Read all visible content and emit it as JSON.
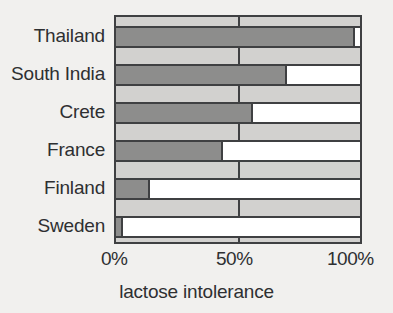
{
  "chart_data": {
    "type": "bar",
    "orientation": "horizontal",
    "title": "",
    "xlabel": "lactose intolerance",
    "ylabel": "",
    "xlim": [
      0,
      100
    ],
    "xticks": [
      0,
      50,
      100
    ],
    "xtick_labels": [
      "0%",
      "50%",
      "100%"
    ],
    "grid": true,
    "legend": false,
    "categories": [
      "Thailand",
      "South India",
      "Crete",
      "France",
      "Finland",
      "Sweden"
    ],
    "values": [
      98,
      70,
      56,
      44,
      14,
      3
    ],
    "series": [
      {
        "name": "lactose intolerance",
        "values": [
          98,
          70,
          56,
          44,
          14,
          3
        ],
        "color": "#8d8d8c"
      },
      {
        "name": "remainder",
        "values": [
          2,
          30,
          44,
          56,
          86,
          97
        ],
        "color": "#ffffff"
      }
    ],
    "units": "%",
    "colors": {
      "bar_fill": "#8d8d8c",
      "bar_remainder": "#ffffff",
      "plot_background": "#d2d1cf",
      "axis_line": "#3f4042",
      "text": "#2e2f31",
      "page_background": "#f1f0ee"
    }
  }
}
